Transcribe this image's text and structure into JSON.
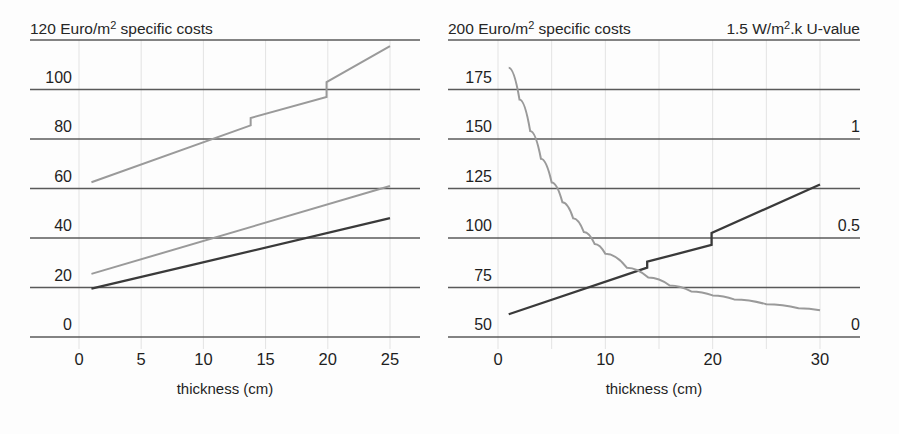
{
  "figure": {
    "background_color": "#fdfdfd",
    "dark_line_color": "#3a3a3a",
    "gray_line_color": "#9a9a9a",
    "gridline_color": "#5a5a5a"
  },
  "left_panel": {
    "header_left": "120 Euro/m",
    "header_left_sup": "2",
    "header_left_tail": " specific costs",
    "xlabel": "thickness (cm)",
    "y_ticks": [
      "120",
      "100",
      "80",
      "60",
      "40",
      "20",
      "0"
    ],
    "x_ticks": [
      "0",
      "5",
      "10",
      "15",
      "20",
      "25"
    ]
  },
  "right_panel": {
    "header_left": "200 Euro/m",
    "header_left_sup": "2",
    "header_left_tail": " specific costs",
    "header_right": "1.5 W/m",
    "header_right_sup": "2",
    "header_right_tail": ".k U-value",
    "xlabel": "thickness (cm)",
    "y_ticks": [
      "200",
      "175",
      "150",
      "125",
      "100",
      "75",
      "50"
    ],
    "y2_ticks": [
      "1.5",
      "",
      "1",
      "",
      "0.5",
      "",
      "0"
    ],
    "x_ticks": [
      "0",
      "10",
      "20",
      "30"
    ]
  },
  "chart_data": [
    {
      "type": "line",
      "id": "left-chart",
      "title": "120 Euro/m2 specific costs",
      "xlabel": "thickness (cm)",
      "ylabel": "Euro/m2 specific costs",
      "xlim": [
        0,
        26
      ],
      "ylim": [
        0,
        120
      ],
      "yticks": [
        0,
        20,
        40,
        60,
        80,
        100,
        120
      ],
      "xticks": [
        0,
        5,
        10,
        15,
        20,
        25
      ],
      "grid": true,
      "legend": "none",
      "series": [
        {
          "name": "upper stepped cost curve",
          "color": "#9a9a9a",
          "style": "stepped-line",
          "x": [
            1,
            13.8,
            13.8,
            19.9,
            19.9,
            25
          ],
          "y": [
            62.5,
            85.5,
            88.5,
            97.0,
            103.0,
            117.5
          ]
        },
        {
          "name": "middle linear cost curve",
          "color": "#9a9a9a",
          "style": "line",
          "x": [
            1,
            25
          ],
          "y": [
            25.5,
            61.0
          ]
        },
        {
          "name": "lower linear cost curve",
          "color": "#3a3a3a",
          "style": "line",
          "x": [
            1,
            25
          ],
          "y": [
            19.5,
            48.0
          ]
        }
      ]
    },
    {
      "type": "line",
      "id": "right-chart",
      "title": "200 Euro/m2 specific costs / 1.5 W/m2.k U-value",
      "xlabel": "thickness (cm)",
      "ylabel": "Euro/m2 specific costs",
      "y2label": "W/m2.k U-value",
      "xlim": [
        0,
        32
      ],
      "ylim": [
        50,
        200
      ],
      "y2lim": [
        0,
        1.5
      ],
      "yticks": [
        50,
        75,
        100,
        125,
        150,
        175,
        200
      ],
      "y2ticks": [
        0,
        0.5,
        1,
        1.5
      ],
      "xticks": [
        0,
        10,
        20,
        30
      ],
      "grid": true,
      "legend": "none",
      "series": [
        {
          "name": "stepped cost curve",
          "color": "#3a3a3a",
          "style": "stepped-line",
          "axis": "left",
          "x": [
            1,
            13.9,
            13.9,
            19.9,
            19.9,
            30
          ],
          "y": [
            61.5,
            85.0,
            88.0,
            96.5,
            102.5,
            127.0
          ]
        },
        {
          "name": "U-value decay curve",
          "color": "#9a9a9a",
          "style": "curve",
          "axis": "right",
          "x": [
            1,
            2,
            3,
            4,
            5,
            6,
            7,
            8,
            9,
            10,
            12,
            14,
            16,
            18,
            20,
            22,
            25,
            28,
            30
          ],
          "y": [
            1.36,
            1.2,
            1.04,
            0.9,
            0.78,
            0.68,
            0.6,
            0.53,
            0.47,
            0.42,
            0.35,
            0.3,
            0.26,
            0.23,
            0.21,
            0.19,
            0.165,
            0.145,
            0.135
          ]
        }
      ]
    }
  ]
}
